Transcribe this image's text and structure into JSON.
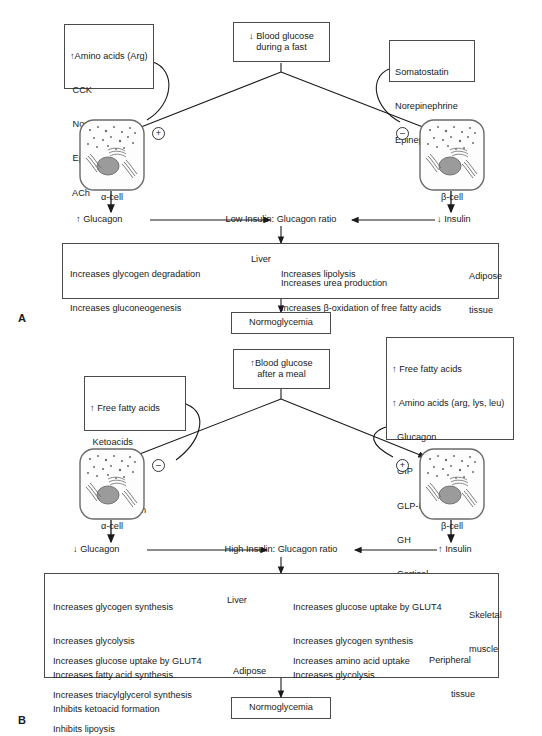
{
  "figure": {
    "title_hidden": "",
    "panels": [
      {
        "letter": "A",
        "stimulus": {
          "line1": "↓ Blood glucose",
          "line2": "during a fast"
        },
        "left_box": {
          "lines": [
            "↑Amino acids (Arg)",
            " CCK",
            " Norepinephrine",
            " Epinephrine",
            " ACh"
          ]
        },
        "right_box": {
          "lines": [
            "Somatostatin",
            "Norepinephrine",
            "Epinephrine"
          ]
        },
        "left_sign": "+",
        "right_sign": "–",
        "left_cell_label": "α-cell",
        "right_cell_label": "β-cell",
        "left_hormone": "↑ Glucagon",
        "right_hormone": "↓ Insulin",
        "ratio": "Low Insulin: Glucagon ratio",
        "effects_left": {
          "lines": [
            "Increases glycogen degradation",
            "Increases gluconeogenesis"
          ],
          "tissue": "Liver"
        },
        "effects_right": {
          "lines": [
            "Increases lipolysis",
            "Increases β-oxidation of free fatty acids"
          ],
          "tissue_line1": "Adipose",
          "tissue_line2": "tissue"
        },
        "effects_extra": "Increases urea production",
        "outcome": "Normoglycemia"
      },
      {
        "letter": "B",
        "stimulus": {
          "line1": "↑Blood glucose",
          "line2": "after a meal"
        },
        "left_box": {
          "lines": [
            "↑ Free fatty acids",
            " Ketoacids",
            " Insulin",
            " Somatostatin"
          ]
        },
        "right_box": {
          "lines": [
            "↑ Free fatty acids",
            "↑ Amino acids (arg, lys, leu)",
            "  Glucagon",
            "  GIP",
            "  GLP-I",
            "  GH",
            "  Cortisol",
            "  ACh"
          ]
        },
        "left_sign": "–",
        "right_sign": "+",
        "left_cell_label": "α-cell",
        "right_cell_label": "β-cell",
        "left_hormone": "↓ Glucagon",
        "right_hormone": "↑ Insulin",
        "ratio": "High Insulin: Glucagon ratio",
        "effects_liver": {
          "lines": [
            "Increases glycogen synthesis",
            "Increases glycolysis",
            "Increases fatty acid synthesis",
            "Inhibits ketoacid formation"
          ],
          "tissue": "Liver"
        },
        "effects_adipose": {
          "lines": [
            "Increases glucose uptake by GLUT4",
            "Increases triacylglycerol synthesis",
            "Inhibits lipoysis"
          ],
          "tissue_line1": "Adipose",
          "tissue_line2": "tissue"
        },
        "effects_muscle": {
          "lines": [
            "Increases glucose uptake by GLUT4",
            "Increases glycogen synthesis",
            "Increases glycolysis"
          ],
          "tissue_line1": "Skeletal",
          "tissue_line2": "muscle"
        },
        "effects_peripheral": {
          "lines": [
            "Increases amino acid uptake"
          ],
          "tissue_line1": "Peripheral",
          "tissue_line2": "tissue"
        },
        "outcome": "Normoglycemia"
      }
    ]
  },
  "colors": {
    "stroke": "#4a4a4a",
    "line": "#1a1a1a",
    "cell_fill": "#fdfdfd",
    "nucleus": "#9b9b9b",
    "background": "#ffffff"
  }
}
